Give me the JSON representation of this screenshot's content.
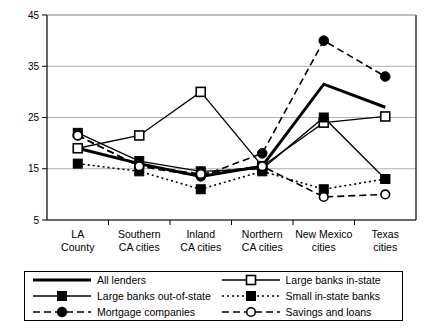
{
  "chart_data": {
    "type": "line",
    "title": "",
    "xlabel": "",
    "ylabel": "",
    "ylim": [
      5,
      45
    ],
    "yticks": [
      5,
      15,
      25,
      35,
      45
    ],
    "grid": true,
    "legend_position": "bottom",
    "categories": [
      "LA County",
      "Southern CA cities",
      "Inland CA cities",
      "Northern CA cities",
      "New Mexico cities",
      "Texas cities"
    ],
    "category_lines": [
      [
        "LA",
        "County"
      ],
      [
        "Southern",
        "CA cities"
      ],
      [
        "Inland",
        "CA cities"
      ],
      [
        "Northern",
        "CA cities"
      ],
      [
        "New Mexico",
        "cities"
      ],
      [
        "Texas",
        "cities"
      ]
    ],
    "series": [
      {
        "name": "All  lenders",
        "style": "solid-thick",
        "marker": "none",
        "color": "#000000",
        "values": [
          19,
          16,
          13.5,
          15.5,
          31.5,
          27
        ]
      },
      {
        "name": "Large banks in-state",
        "style": "solid-thin",
        "marker": "open-square",
        "color": "#000000",
        "values": [
          19,
          21.5,
          30,
          15.5,
          24,
          25.2
        ]
      },
      {
        "name": "Large banks out-of-state",
        "style": "solid-thin",
        "marker": "filled-square",
        "color": "#000000",
        "values": [
          22,
          16.5,
          14.5,
          15,
          25,
          13
        ]
      },
      {
        "name": "Small in-state banks",
        "style": "dotted",
        "marker": "filled-square",
        "color": "#000000",
        "values": [
          16,
          14.5,
          11,
          14.5,
          11,
          13
        ]
      },
      {
        "name": "Mortgage companies",
        "style": "dashed",
        "marker": "filled-circle",
        "color": "#000000",
        "values": [
          21.5,
          15.5,
          13.5,
          18,
          40,
          33
        ]
      },
      {
        "name": "Savings and loans",
        "style": "dashed",
        "marker": "open-circle",
        "color": "#000000",
        "values": [
          21.5,
          15.5,
          14,
          15.5,
          9.5,
          10
        ]
      }
    ]
  },
  "legend": {
    "entries": [
      {
        "label": "All  lenders",
        "marker": "none",
        "style": "solid-thick"
      },
      {
        "label": "Large banks in-state",
        "marker": "open-square",
        "style": "solid-thin"
      },
      {
        "label": "Large banks out-of-state",
        "marker": "filled-square",
        "style": "solid-thin"
      },
      {
        "label": "Small in-state banks",
        "marker": "filled-square",
        "style": "dotted"
      },
      {
        "label": "Mortgage companies",
        "marker": "filled-circle",
        "style": "dashed"
      },
      {
        "label": "Savings and loans",
        "marker": "open-circle",
        "style": "dashed"
      }
    ]
  }
}
